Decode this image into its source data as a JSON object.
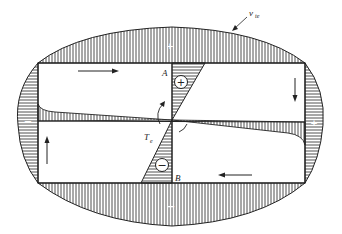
{
  "diagram": {
    "labels": {
      "velocity": "v",
      "velocity_sub": "te",
      "point_a": "A",
      "point_b": "B",
      "torque": "T",
      "torque_sub": "e"
    },
    "signs": {
      "top_lobe": "+",
      "bottom_lobe": "−",
      "left_lobe": "−",
      "right_lobe": "+",
      "upper_triangle": "+",
      "lower_triangle": "−"
    },
    "colors": {
      "line": "#222222",
      "background": "#ffffff"
    }
  }
}
